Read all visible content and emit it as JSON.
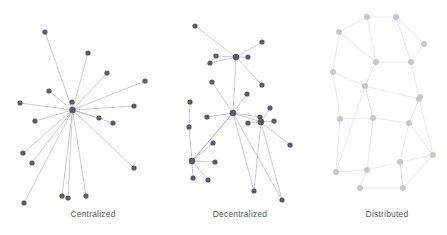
{
  "figure": {
    "width": 447,
    "height": 235,
    "background": "#ffffff",
    "caption_color": "#5a5a5a"
  },
  "chart_data": {
    "type": "diagram",
    "subtype": "node-link graph triptych",
    "panel_count": 3,
    "panels": [
      {
        "id": "centralized",
        "label": "Centralized",
        "label_x": 93,
        "label_y": 215,
        "node_color": "#5b5b66",
        "edge_color": "#a0a0a8",
        "node_radius": 2.6,
        "hub_radius": 3.2,
        "edge_width": 0.55,
        "description": "single central hub connected to all peripheral nodes",
        "hub_index": 0,
        "nodes": [
          {
            "id": 0,
            "x": 72.5,
            "y": 110.0,
            "hub": true
          },
          {
            "id": 1,
            "x": 45.0,
            "y": 32.0,
            "hub": false
          },
          {
            "id": 2,
            "x": 88.0,
            "y": 53.0,
            "hub": false
          },
          {
            "id": 3,
            "x": 107.0,
            "y": 73.0,
            "hub": false
          },
          {
            "id": 4,
            "x": 145.0,
            "y": 81.0,
            "hub": false
          },
          {
            "id": 5,
            "x": 134.0,
            "y": 106.0,
            "hub": false
          },
          {
            "id": 6,
            "x": 49.0,
            "y": 91.0,
            "hub": false
          },
          {
            "id": 7,
            "x": 20.0,
            "y": 103.0,
            "hub": false
          },
          {
            "id": 8,
            "x": 72.0,
            "y": 102.0,
            "hub": false
          },
          {
            "id": 9,
            "x": 99.0,
            "y": 118.0,
            "hub": false
          },
          {
            "id": 10,
            "x": 113.0,
            "y": 123.0,
            "hub": false
          },
          {
            "id": 11,
            "x": 35.0,
            "y": 121.0,
            "hub": false
          },
          {
            "id": 12,
            "x": 23.0,
            "y": 153.0,
            "hub": false
          },
          {
            "id": 13,
            "x": 32.0,
            "y": 163.0,
            "hub": false
          },
          {
            "id": 14,
            "x": 134.0,
            "y": 168.0,
            "hub": false
          },
          {
            "id": 15,
            "x": 24.0,
            "y": 203.0,
            "hub": false
          },
          {
            "id": 16,
            "x": 62.0,
            "y": 196.0,
            "hub": false
          },
          {
            "id": 17,
            "x": 68.0,
            "y": 198.0,
            "hub": false
          },
          {
            "id": 18,
            "x": 86.0,
            "y": 196.0,
            "hub": false
          }
        ],
        "edges": [
          [
            0,
            1
          ],
          [
            0,
            2
          ],
          [
            0,
            3
          ],
          [
            0,
            4
          ],
          [
            0,
            5
          ],
          [
            0,
            6
          ],
          [
            0,
            7
          ],
          [
            0,
            8
          ],
          [
            0,
            9
          ],
          [
            0,
            10
          ],
          [
            0,
            11
          ],
          [
            0,
            12
          ],
          [
            0,
            13
          ],
          [
            0,
            14
          ],
          [
            0,
            15
          ],
          [
            0,
            16
          ],
          [
            0,
            17
          ],
          [
            0,
            18
          ]
        ]
      },
      {
        "id": "decentralized",
        "label": "Decentralized",
        "label_x": 240,
        "label_y": 215,
        "node_color": "#5b5b66",
        "edge_color": "#a0a0a8",
        "node_radius": 2.6,
        "hub_radius": 3.3,
        "edge_width": 0.55,
        "description": "several local hubs each serving a cluster, hubs interlinked",
        "hub_indices": [
          3,
          9,
          14,
          16
        ],
        "nodes": [
          {
            "id": 0,
            "x": 195.0,
            "y": 26.0,
            "hub": false
          },
          {
            "id": 1,
            "x": 262.0,
            "y": 42.0,
            "hub": false
          },
          {
            "id": 2,
            "x": 216.0,
            "y": 56.0,
            "hub": false
          },
          {
            "id": 3,
            "x": 236.0,
            "y": 57.0,
            "hub": true
          },
          {
            "id": 4,
            "x": 248.0,
            "y": 57.0,
            "hub": false
          },
          {
            "id": 5,
            "x": 210.0,
            "y": 63.0,
            "hub": false
          },
          {
            "id": 6,
            "x": 262.0,
            "y": 85.0,
            "hub": false
          },
          {
            "id": 7,
            "x": 212.0,
            "y": 82.0,
            "hub": false
          },
          {
            "id": 8,
            "x": 247.0,
            "y": 94.0,
            "hub": false
          },
          {
            "id": 9,
            "x": 233.0,
            "y": 113.0,
            "hub": true
          },
          {
            "id": 10,
            "x": 207.0,
            "y": 117.0,
            "hub": false
          },
          {
            "id": 11,
            "x": 260.0,
            "y": 117.0,
            "hub": false
          },
          {
            "id": 12,
            "x": 270.0,
            "y": 108.0,
            "hub": false
          },
          {
            "id": 13,
            "x": 248.0,
            "y": 123.0,
            "hub": false
          },
          {
            "id": 14,
            "x": 261.0,
            "y": 122.0,
            "hub": true
          },
          {
            "id": 15,
            "x": 274.0,
            "y": 121.0,
            "hub": false
          },
          {
            "id": 16,
            "x": 192.0,
            "y": 161.0,
            "hub": true
          },
          {
            "id": 17,
            "x": 189.0,
            "y": 127.0,
            "hub": false
          },
          {
            "id": 18,
            "x": 213.0,
            "y": 143.0,
            "hub": false
          },
          {
            "id": 19,
            "x": 215.0,
            "y": 162.0,
            "hub": false
          },
          {
            "id": 20,
            "x": 193.0,
            "y": 178.0,
            "hub": false
          },
          {
            "id": 21,
            "x": 208.0,
            "y": 180.0,
            "hub": false
          },
          {
            "id": 22,
            "x": 290.0,
            "y": 145.0,
            "hub": false
          },
          {
            "id": 23,
            "x": 254.0,
            "y": 191.0,
            "hub": false
          },
          {
            "id": 24,
            "x": 282.0,
            "y": 200.0,
            "hub": false
          },
          {
            "id": 25,
            "x": 190.0,
            "y": 102.0,
            "hub": false
          }
        ],
        "edges": [
          [
            0,
            3
          ],
          [
            1,
            3
          ],
          [
            2,
            3
          ],
          [
            4,
            3
          ],
          [
            5,
            3
          ],
          [
            5,
            2
          ],
          [
            3,
            9
          ],
          [
            3,
            6
          ],
          [
            9,
            7
          ],
          [
            9,
            10
          ],
          [
            9,
            8
          ],
          [
            9,
            11
          ],
          [
            9,
            14
          ],
          [
            9,
            16
          ],
          [
            9,
            23
          ],
          [
            9,
            24
          ],
          [
            14,
            12
          ],
          [
            14,
            13
          ],
          [
            14,
            15
          ],
          [
            14,
            22
          ],
          [
            14,
            23
          ],
          [
            14,
            24
          ],
          [
            16,
            17
          ],
          [
            16,
            18
          ],
          [
            16,
            19
          ],
          [
            16,
            20
          ],
          [
            16,
            21
          ],
          [
            16,
            9
          ],
          [
            17,
            25
          ]
        ]
      },
      {
        "id": "distributed",
        "label": "Distributed",
        "label_x": 387,
        "label_y": 215,
        "node_color": "#c6c6cc",
        "edge_color": "#e2e2e6",
        "node_radius": 3.0,
        "hub_radius": 3.0,
        "edge_width": 0.8,
        "description": "mesh of peers, every node linked to several neighbours, no hub",
        "nodes": [
          {
            "id": 0,
            "x": 367.0,
            "y": 17.0,
            "hub": false
          },
          {
            "id": 1,
            "x": 396.0,
            "y": 17.0,
            "hub": false
          },
          {
            "id": 2,
            "x": 339.0,
            "y": 32.0,
            "hub": false
          },
          {
            "id": 3,
            "x": 424.0,
            "y": 44.0,
            "hub": false
          },
          {
            "id": 4,
            "x": 376.0,
            "y": 62.0,
            "hub": false
          },
          {
            "id": 5,
            "x": 411.0,
            "y": 62.0,
            "hub": false
          },
          {
            "id": 6,
            "x": 333.0,
            "y": 72.0,
            "hub": false
          },
          {
            "id": 7,
            "x": 365.0,
            "y": 86.0,
            "hub": false
          },
          {
            "id": 8,
            "x": 420.0,
            "y": 97.0,
            "hub": false
          },
          {
            "id": 9,
            "x": 419.0,
            "y": 99.0,
            "hub": false
          },
          {
            "id": 10,
            "x": 340.0,
            "y": 119.0,
            "hub": false
          },
          {
            "id": 11,
            "x": 373.0,
            "y": 118.0,
            "hub": false
          },
          {
            "id": 12,
            "x": 409.0,
            "y": 123.0,
            "hub": false
          },
          {
            "id": 13,
            "x": 433.0,
            "y": 155.0,
            "hub": false
          },
          {
            "id": 14,
            "x": 400.0,
            "y": 162.0,
            "hub": false
          },
          {
            "id": 15,
            "x": 336.0,
            "y": 172.0,
            "hub": false
          },
          {
            "id": 16,
            "x": 367.0,
            "y": 170.0,
            "hub": false
          },
          {
            "id": 17,
            "x": 360.0,
            "y": 188.0,
            "hub": false
          },
          {
            "id": 18,
            "x": 403.0,
            "y": 188.0,
            "hub": false
          }
        ],
        "edges": [
          [
            0,
            1
          ],
          [
            0,
            2
          ],
          [
            0,
            4
          ],
          [
            1,
            3
          ],
          [
            1,
            5
          ],
          [
            2,
            6
          ],
          [
            2,
            4
          ],
          [
            3,
            5
          ],
          [
            4,
            5
          ],
          [
            4,
            7
          ],
          [
            5,
            9
          ],
          [
            6,
            7
          ],
          [
            7,
            4
          ],
          [
            7,
            11
          ],
          [
            7,
            9
          ],
          [
            9,
            8
          ],
          [
            8,
            12
          ],
          [
            9,
            12
          ],
          [
            9,
            13
          ],
          [
            10,
            11
          ],
          [
            10,
            15
          ],
          [
            10,
            6
          ],
          [
            11,
            12
          ],
          [
            11,
            16
          ],
          [
            12,
            14
          ],
          [
            12,
            13
          ],
          [
            13,
            14
          ],
          [
            13,
            18
          ],
          [
            14,
            16
          ],
          [
            14,
            18
          ],
          [
            15,
            16
          ],
          [
            16,
            17
          ],
          [
            17,
            18
          ],
          [
            18,
            14
          ],
          [
            7,
            15
          ],
          [
            11,
            7
          ]
        ]
      }
    ]
  }
}
